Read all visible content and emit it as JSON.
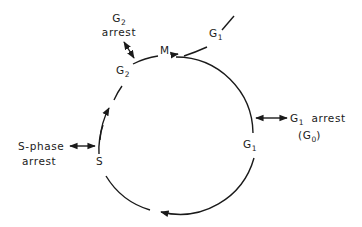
{
  "diagram": {
    "type": "cell-cycle",
    "stroke_color": "#1a1a1a",
    "phases": {
      "m": {
        "label": "M"
      },
      "g1_exit": {
        "main": "G",
        "sub": "1"
      },
      "g1": {
        "main": "G",
        "sub": "1"
      },
      "s": {
        "label": "S"
      },
      "g2": {
        "main": "G",
        "sub": "2"
      }
    },
    "arrests": {
      "g2": {
        "line1_main": "G",
        "line1_sub": "2",
        "line2": "arrest"
      },
      "g1": {
        "line1_main": "G",
        "line1_sub": "1",
        "line1_rest": "arrest",
        "line2_open": "(G",
        "line2_sub": "0",
        "line2_close": ")"
      },
      "s": {
        "line1": "S-phase",
        "line2": "arrest"
      }
    }
  }
}
